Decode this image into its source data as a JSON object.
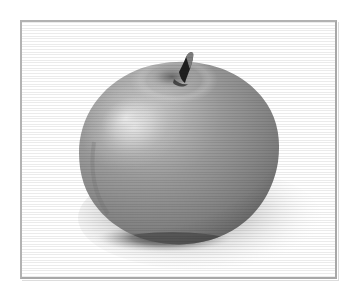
{
  "figure": {
    "kind": "photograph",
    "color_mode": "grayscale",
    "frame": {
      "visible": true,
      "style": "thin rectangular rule",
      "border_color": "#b2b2b2",
      "background_color": "#ffffff"
    },
    "palette": {
      "page_background": "#ffffff",
      "frame_border": "#b2b2b2",
      "frame_bevel": "#dcdcdc",
      "apple_midtone": "#8e8e8e",
      "apple_highlight": "#e2e2e2",
      "apple_shade": "#5c5c5c",
      "apple_rim_dark": "#4a4a4a",
      "stem_dark": "#1e1e1e",
      "stem_light": "#9a9a9a",
      "contact_shadow": "#3a3a3a",
      "cast_shadow": "#b8b8b8"
    },
    "elements": {
      "apple_body_label": "apple body",
      "apple_highlight_label": "specular highlight",
      "apple_stem_label": "apple stem",
      "apple_calyx_label": "stem well",
      "contact_shadow_label": "contact shadow",
      "cast_shadow_label": "cast shadow"
    },
    "lighting": {
      "key_light_direction": "upper left",
      "shadow_direction": "lower right"
    }
  }
}
